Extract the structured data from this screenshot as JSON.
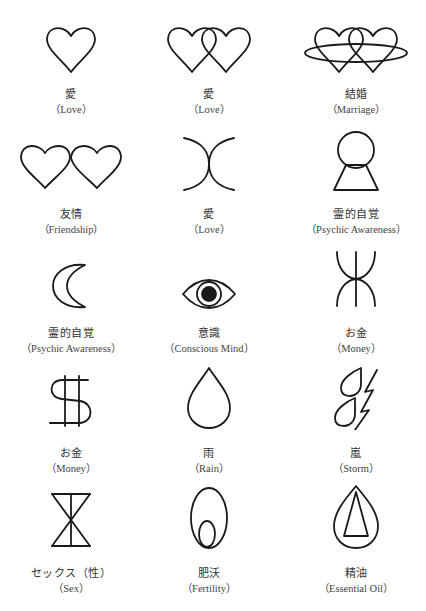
{
  "symbols": [
    {
      "icon": "heart-icon",
      "jp": "愛",
      "en": "（Love）"
    },
    {
      "icon": "double-heart-icon",
      "jp": "愛",
      "en": "（Love）"
    },
    {
      "icon": "ringed-hearts-icon",
      "jp": "結婚",
      "en": "（Marriage）"
    },
    {
      "icon": "joined-hearts-icon",
      "jp": "友情",
      "en": "（Friendship）"
    },
    {
      "icon": "touching-arcs-icon",
      "jp": "愛",
      "en": "（Love）"
    },
    {
      "icon": "crystal-ball-icon",
      "jp": "霊的自覚",
      "en": "（Psychic Awareness）"
    },
    {
      "icon": "crescent-moon-icon",
      "jp": "霊的自覚",
      "en": "（Psychic Awareness）"
    },
    {
      "icon": "eye-icon",
      "jp": "意識",
      "en": "（Conscious Mind）"
    },
    {
      "icon": "money-arcs-icon",
      "jp": "お金",
      "en": "（Money）"
    },
    {
      "icon": "dollar-sign-icon",
      "jp": "お金",
      "en": "（Money）"
    },
    {
      "icon": "raindrop-icon",
      "jp": "雨",
      "en": "（Rain）"
    },
    {
      "icon": "storm-drops-lightning-icon",
      "jp": "嵐",
      "en": "（Storm）"
    },
    {
      "icon": "hourglass-icon",
      "jp": "セックス（性）",
      "en": "（Sex）"
    },
    {
      "icon": "egg-icon",
      "jp": "肥沃",
      "en": "（Fertility）"
    },
    {
      "icon": "drop-triangle-icon",
      "jp": "精油",
      "en": "（Essential Oil）"
    }
  ]
}
